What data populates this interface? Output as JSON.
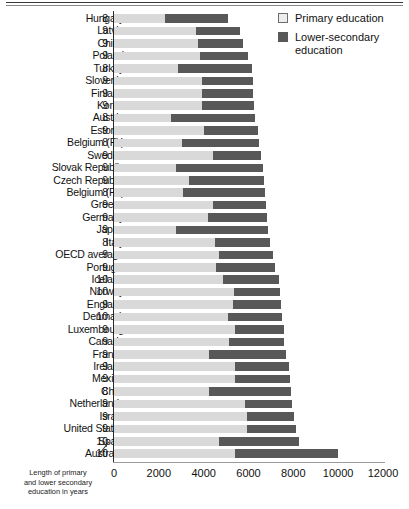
{
  "chart_data": {
    "type": "bar",
    "orientation": "horizontal",
    "stacked": true,
    "title": "",
    "xlabel": "",
    "ylabel": "",
    "xlim": [
      0,
      12000
    ],
    "xticks": [
      0,
      2000,
      4000,
      6000,
      8000,
      10000,
      12000
    ],
    "xtick_labels": [
      "0",
      "2000",
      "4000",
      "6000",
      "8000",
      "10000",
      "12000"
    ],
    "grid": false,
    "legend_position": "top-right",
    "series": [
      {
        "name": "Primary education",
        "color": "#d9d9d9",
        "values": [
          2280,
          3660,
          3740,
          3830,
          2850,
          3920,
          3930,
          3920,
          2560,
          4030,
          3020,
          4420,
          2760,
          3350,
          3060,
          4410,
          4190,
          2750,
          4520,
          4690,
          4530,
          4880,
          5350,
          5330,
          5100,
          5410,
          5130,
          4250,
          5420,
          5420,
          4220,
          5850,
          5950,
          5950,
          4670,
          5380
        ]
      },
      {
        "name": "Lower-secondary education",
        "color": "#585858",
        "values": [
          2810,
          1950,
          2030,
          2170,
          3320,
          2270,
          2280,
          2310,
          3750,
          2380,
          3440,
          2120,
          3870,
          3340,
          3670,
          2360,
          2620,
          4110,
          2460,
          2420,
          2650,
          2460,
          2040,
          2100,
          2410,
          2180,
          2460,
          3440,
          2380,
          2410,
          3670,
          2080,
          2100,
          2190,
          3600,
          4600
        ]
      }
    ],
    "categories": [
      "Hungary",
      "Latvia",
      "China",
      "Poland",
      "Turkey",
      "Slovenia",
      "Finland",
      "Korea",
      "Austria",
      "Estonia",
      "Belgium (Fl.)",
      "Sweden",
      "Slovak Republic",
      "Czech Republic",
      "Belgium (Fr.)",
      "Greece",
      "Germany",
      "Japan",
      "Italy",
      "OECD average",
      "Portugal",
      "Iceland",
      "Norway",
      "England",
      "Denmark",
      "Luxembourg",
      "Canada",
      "France",
      "Ireland",
      "Mexico",
      "Chile",
      "Netherlands",
      "Israel",
      "United States",
      "Spain",
      "Australia"
    ],
    "years": [
      8,
      9,
      9,
      9,
      8,
      9,
      9,
      9,
      8,
      9,
      8,
      9,
      9,
      9,
      8,
      9,
      9,
      9,
      8,
      9,
      9,
      10,
      10,
      9,
      10,
      9,
      9,
      9,
      9,
      9,
      8,
      9,
      9,
      9,
      10,
      10
    ],
    "rows": [
      {
        "category": "Hungary",
        "years": 8,
        "primary": 2280,
        "lower": 2810,
        "total": 5090
      },
      {
        "category": "Latvia",
        "years": 9,
        "primary": 3660,
        "lower": 1950,
        "total": 5610
      },
      {
        "category": "China",
        "years": 9,
        "primary": 3740,
        "lower": 2030,
        "total": 5770
      },
      {
        "category": "Poland",
        "years": 9,
        "primary": 3830,
        "lower": 2170,
        "total": 6000
      },
      {
        "category": "Turkey",
        "years": 8,
        "primary": 2850,
        "lower": 3320,
        "total": 6170
      },
      {
        "category": "Slovenia",
        "years": 9,
        "primary": 3920,
        "lower": 2270,
        "total": 6190
      },
      {
        "category": "Finland",
        "years": 9,
        "primary": 3930,
        "lower": 2280,
        "total": 6210
      },
      {
        "category": "Korea",
        "years": 9,
        "primary": 3920,
        "lower": 2310,
        "total": 6230
      },
      {
        "category": "Austria",
        "years": 8,
        "primary": 2560,
        "lower": 3750,
        "total": 6310
      },
      {
        "category": "Estonia",
        "years": 9,
        "primary": 4030,
        "lower": 2380,
        "total": 6410
      },
      {
        "category": "Belgium (Fl.)",
        "years": 8,
        "primary": 3020,
        "lower": 3440,
        "total": 6460
      },
      {
        "category": "Sweden",
        "years": 9,
        "primary": 4420,
        "lower": 2120,
        "total": 6540
      },
      {
        "category": "Slovak Republic",
        "years": 9,
        "primary": 2760,
        "lower": 3870,
        "total": 6630
      },
      {
        "category": "Czech Republic",
        "years": 9,
        "primary": 3350,
        "lower": 3340,
        "total": 6690
      },
      {
        "category": "Belgium (Fr.)",
        "years": 8,
        "primary": 3060,
        "lower": 3670,
        "total": 6730
      },
      {
        "category": "Greece",
        "years": 9,
        "primary": 4410,
        "lower": 2360,
        "total": 6770
      },
      {
        "category": "Germany",
        "years": 9,
        "primary": 4190,
        "lower": 2620,
        "total": 6810
      },
      {
        "category": "Japan",
        "years": 9,
        "primary": 2750,
        "lower": 4110,
        "total": 6860
      },
      {
        "category": "Italy",
        "years": 8,
        "primary": 4520,
        "lower": 2460,
        "total": 6980
      },
      {
        "category": "OECD average",
        "years": 9,
        "primary": 4690,
        "lower": 2420,
        "total": 7110
      },
      {
        "category": "Portugal",
        "years": 9,
        "primary": 4530,
        "lower": 2650,
        "total": 7180
      },
      {
        "category": "Iceland",
        "years": 10,
        "primary": 4880,
        "lower": 2460,
        "total": 7340
      },
      {
        "category": "Norway",
        "years": 10,
        "primary": 5350,
        "lower": 2040,
        "total": 7390
      },
      {
        "category": "England",
        "years": 9,
        "primary": 5330,
        "lower": 2100,
        "total": 7430
      },
      {
        "category": "Denmark",
        "years": 10,
        "primary": 5100,
        "lower": 2410,
        "total": 7510
      },
      {
        "category": "Luxembourg",
        "years": 9,
        "primary": 5410,
        "lower": 2180,
        "total": 7590
      },
      {
        "category": "Canada",
        "years": 9,
        "primary": 5130,
        "lower": 2460,
        "total": 7590
      },
      {
        "category": "France",
        "years": 9,
        "primary": 4250,
        "lower": 3440,
        "total": 7690
      },
      {
        "category": "Ireland",
        "years": 9,
        "primary": 5420,
        "lower": 2380,
        "total": 7800
      },
      {
        "category": "Mexico",
        "years": 9,
        "primary": 5420,
        "lower": 2410,
        "total": 7830
      },
      {
        "category": "Chile",
        "years": 8,
        "primary": 4220,
        "lower": 3670,
        "total": 7890
      },
      {
        "category": "Netherlands",
        "years": 9,
        "primary": 5850,
        "lower": 2080,
        "total": 7930
      },
      {
        "category": "Israel",
        "years": 9,
        "primary": 5950,
        "lower": 2100,
        "total": 8050
      },
      {
        "category": "United States",
        "years": 9,
        "primary": 5950,
        "lower": 2190,
        "total": 8140
      },
      {
        "category": "Spain",
        "years": 10,
        "primary": 4670,
        "lower": 3600,
        "total": 8270
      },
      {
        "category": "Australia",
        "years": 10,
        "primary": 5380,
        "lower": 4600,
        "total": 9980
      }
    ]
  },
  "legend": {
    "items": [
      {
        "label": "Primary education",
        "label2": "",
        "color": "#d9d9d9",
        "swatch": "primary"
      },
      {
        "label": "Lower-secondary",
        "label2": "education",
        "color": "#585858",
        "swatch": "lower"
      }
    ]
  },
  "footnote": {
    "line1": "Length of  primary",
    "line2": "and lower secondary",
    "line3": "education in years"
  }
}
